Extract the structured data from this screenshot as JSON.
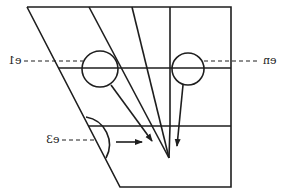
{
  "diagram": {
    "labels": {
      "left": "e1",
      "right": "en",
      "bottom": "e3"
    },
    "colors": {
      "stroke": "#1e1e1e",
      "background": "#ffffff"
    },
    "note": "Image is horizontally mirrored; labels are rendered mirrored."
  }
}
